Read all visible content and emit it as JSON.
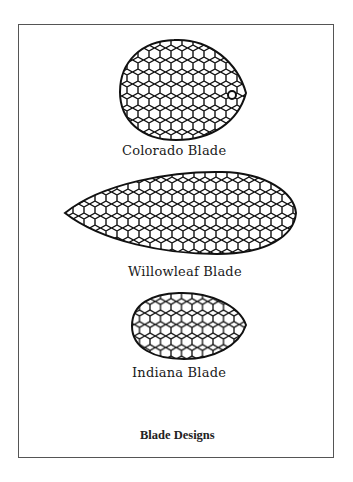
{
  "figure": {
    "caption": "Blade Designs",
    "blades": [
      {
        "name": "Colorado Blade"
      },
      {
        "name": "Willowleaf Blade"
      },
      {
        "name": "Indiana Blade"
      }
    ]
  }
}
